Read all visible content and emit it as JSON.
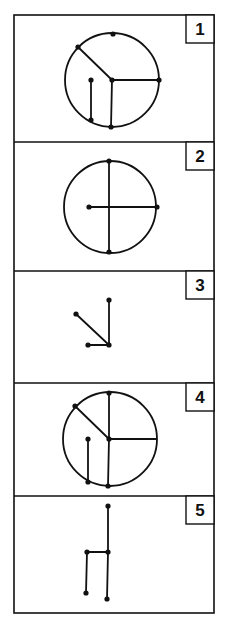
{
  "colors": {
    "ink": "#111111",
    "paper": "#ffffff"
  },
  "panels": [
    {
      "label": "1",
      "circle": {
        "cx": 112,
        "cy": 80,
        "r": 47
      },
      "segments": [
        [
          112,
          80,
          78,
          47
        ],
        [
          112,
          80,
          159,
          80
        ],
        [
          112,
          80,
          111,
          127
        ],
        [
          91,
          80,
          91,
          120
        ]
      ],
      "dots": [
        [
          113,
          34
        ],
        [
          78,
          47
        ],
        [
          112,
          80
        ],
        [
          159,
          80
        ],
        [
          91,
          80
        ],
        [
          91,
          120
        ],
        [
          111,
          127
        ]
      ]
    },
    {
      "label": "2",
      "circle": {
        "cx": 110,
        "cy": 207,
        "r": 46
      },
      "segments": [
        [
          109,
          161,
          109,
          252
        ],
        [
          89,
          207,
          157,
          207
        ]
      ],
      "dots": [
        [
          109,
          161
        ],
        [
          89,
          207
        ],
        [
          157,
          207
        ],
        [
          109,
          252
        ]
      ]
    },
    {
      "label": "3",
      "circle": null,
      "segments": [
        [
          109,
          300,
          109,
          345
        ],
        [
          76,
          314,
          109,
          345
        ],
        [
          88,
          345,
          109,
          345
        ]
      ],
      "dots": [
        [
          109,
          300
        ],
        [
          76,
          314
        ],
        [
          109,
          345
        ],
        [
          88,
          345
        ]
      ]
    },
    {
      "label": "4",
      "circle": {
        "cx": 110,
        "cy": 439,
        "r": 47
      },
      "segments": [
        [
          109,
          393,
          109,
          439
        ],
        [
          75,
          406,
          109,
          439
        ],
        [
          109,
          439,
          156,
          439
        ],
        [
          109,
          439,
          108,
          486
        ],
        [
          88,
          439,
          88,
          482
        ]
      ],
      "dots": [
        [
          109,
          393
        ],
        [
          75,
          406
        ],
        [
          109,
          439
        ],
        [
          88,
          439
        ],
        [
          88,
          482
        ],
        [
          108,
          486
        ]
      ]
    },
    {
      "label": "5",
      "circle": null,
      "segments": [
        [
          108,
          506,
          108,
          552
        ],
        [
          108,
          552,
          107,
          599
        ],
        [
          87,
          552,
          108,
          552
        ],
        [
          87,
          552,
          86,
          593
        ]
      ],
      "dots": [
        [
          108,
          506
        ],
        [
          108,
          552
        ],
        [
          87,
          552
        ],
        [
          86,
          593
        ],
        [
          107,
          599
        ]
      ]
    }
  ],
  "frame": {
    "left": 14,
    "right": 214,
    "top": 15,
    "bottom": 613,
    "dividers": [
      142,
      271,
      383,
      496
    ],
    "label_box": {
      "width": 28,
      "height": 28
    }
  }
}
